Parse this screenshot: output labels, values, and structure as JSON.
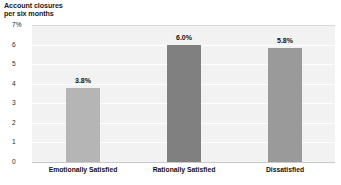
{
  "chart_data": {
    "type": "bar",
    "title": "Account closures per six months",
    "title_lines": [
      "Account closures",
      "per six months"
    ],
    "xlabel": "",
    "ylabel": "",
    "categories": [
      "Emotionally Satisfied",
      "Rationally Satisfied",
      "Dissatisfied"
    ],
    "values": [
      3.8,
      6.0,
      5.8
    ],
    "data_labels": [
      "3.8%",
      "6.0%",
      "5.8%"
    ],
    "ylim": [
      0,
      7
    ],
    "yticks": [
      7,
      6,
      5,
      4,
      3,
      2,
      1,
      0
    ],
    "ytick_labels": [
      "7%",
      "6",
      "5",
      "4",
      "3",
      "2",
      "1",
      "0"
    ],
    "grid": true,
    "legend": false,
    "bar_colors": [
      "#b5b5b5",
      "#808080",
      "#9a9a9a"
    ],
    "plot_background": "#f2f2f2",
    "gridline_color": "#ffffff",
    "axis_color": "#c9c9c9"
  }
}
